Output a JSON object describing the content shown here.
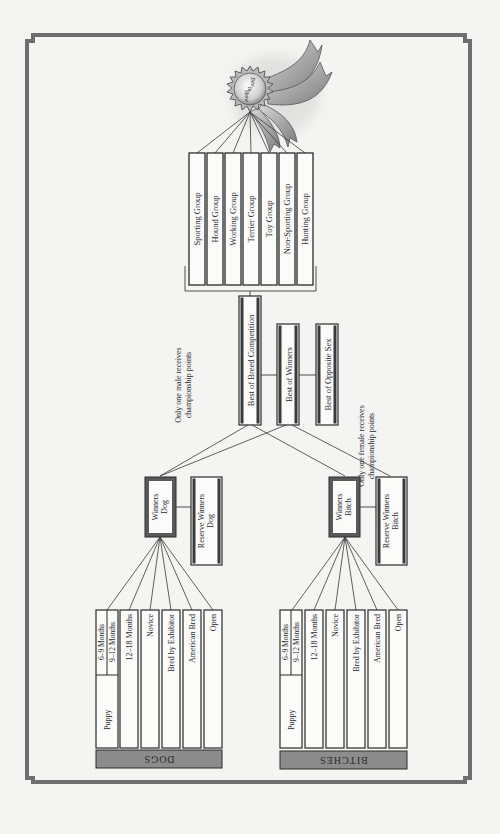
{
  "diagram": {
    "award": {
      "label": "Best in Show",
      "lines": [
        "Best",
        "In",
        "Show"
      ],
      "ribbon_color": "#9a9a9a"
    },
    "groups": [
      {
        "label": "Sporting Group"
      },
      {
        "label": "Hound Group"
      },
      {
        "label": "Working Group"
      },
      {
        "label": "Terrier Group"
      },
      {
        "label": "Toy Group"
      },
      {
        "label": "Non-Sporting Group"
      },
      {
        "label": "Hunting Group"
      }
    ],
    "breed_level": {
      "best_of_breed": "Best of Breed Competition",
      "best_of_winners": "Best of Winners",
      "best_of_opposite_sex": "Best of Opposite Sex"
    },
    "notes": {
      "male": [
        "Only one male receives",
        "championship points"
      ],
      "female": [
        "Only one female receives",
        "championship points"
      ]
    },
    "dogs": {
      "section_label": "DOGS",
      "winners": [
        "Winners",
        "Dog"
      ],
      "reserve": [
        "Reserve Winners",
        "Dog"
      ],
      "classes": {
        "puppy": "Puppy",
        "puppy_sub": [
          "6–9 Months",
          "9–12 Months"
        ],
        "others": [
          "12–18 Months",
          "Novice",
          "Bred by Exhibitor",
          "American Bred",
          "Open"
        ]
      }
    },
    "bitches": {
      "section_label": "BITCHES",
      "winners": [
        "Winners",
        "Bitch"
      ],
      "reserve": [
        "Reserve Winners",
        "Bitch"
      ],
      "classes": {
        "puppy": "Puppy",
        "puppy_sub": [
          "6–9 Months",
          "9–12 Months"
        ],
        "others": [
          "12–18 Months",
          "Novice",
          "Bred by Exhibitor",
          "American Bred",
          "Open"
        ]
      }
    },
    "colors": {
      "frame": "#6e6e6e",
      "line": "#3a3a3a",
      "band": "#8c8c8c",
      "box_border_dark": "#3a3a3a",
      "paper": "#f4f4f2"
    }
  }
}
